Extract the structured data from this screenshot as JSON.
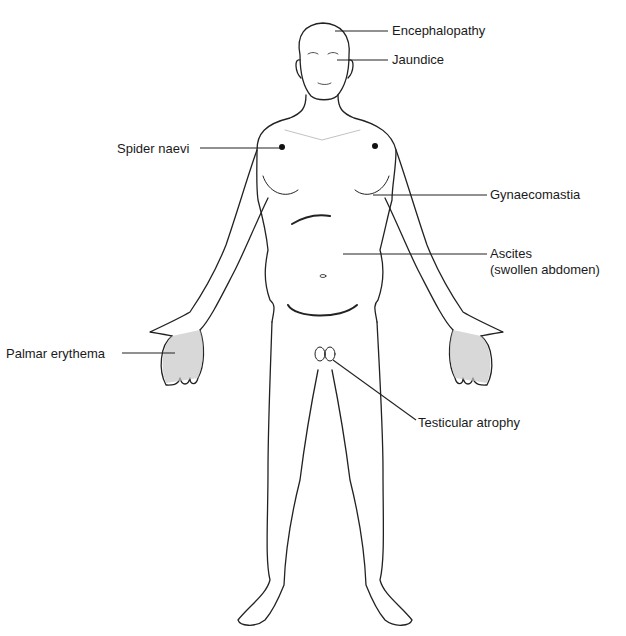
{
  "diagram": {
    "line_color": "#222222",
    "shade_color": "#bdbdbd",
    "labels": [
      {
        "id": "encephalopathy",
        "text": "Encephalopathy",
        "x": 392,
        "y": 23
      },
      {
        "id": "jaundice",
        "text": "Jaundice",
        "x": 392,
        "y": 52
      },
      {
        "id": "spider-naevi",
        "text": "Spider naevi",
        "x": 117,
        "y": 141
      },
      {
        "id": "gynaecomastia",
        "text": "Gynaecomastia",
        "x": 490,
        "y": 187
      },
      {
        "id": "ascites",
        "text": "Ascites",
        "x": 490,
        "y": 246
      },
      {
        "id": "ascites-sub",
        "text": "(swollen abdomen)",
        "x": 490,
        "y": 262
      },
      {
        "id": "palmar-erythema",
        "text": "Palmar erythema",
        "x": 6,
        "y": 346
      },
      {
        "id": "testicular-atrophy",
        "text": "Testicular atrophy",
        "x": 418,
        "y": 415
      }
    ]
  }
}
